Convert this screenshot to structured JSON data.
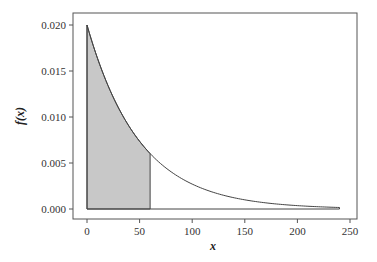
{
  "chart_data": {
    "type": "area",
    "title": "",
    "xlabel": "x",
    "ylabel": "f(x)",
    "xlim": [
      -14,
      262
    ],
    "ylim": [
      -0.0011,
      0.0214
    ],
    "xticks": [
      0,
      50,
      100,
      150,
      200,
      250
    ],
    "yticks": [
      0.0,
      0.005,
      0.01,
      0.015,
      0.02
    ],
    "xtick_labels": [
      "0",
      "50",
      "100",
      "150",
      "200",
      "250"
    ],
    "ytick_labels": [
      "0.000",
      "0.005",
      "0.010",
      "0.015",
      "0.020"
    ],
    "grid": false,
    "series": [
      {
        "name": "f(x) = 0.02 e^(-0.02x)",
        "function": "exponential_pdf",
        "rate": 0.02,
        "x_range": [
          0,
          240
        ],
        "x": [
          0,
          20,
          40,
          60,
          80,
          100,
          120,
          140,
          160,
          180,
          200,
          220,
          240
        ],
        "values": [
          0.02,
          0.0134,
          0.009,
          0.006,
          0.004,
          0.0027,
          0.0018,
          0.0012,
          0.0008,
          0.0005,
          0.0004,
          0.0002,
          0.0002
        ]
      }
    ],
    "shaded_region": {
      "x_from": 0,
      "x_to": 60,
      "color": "#c8c8c8"
    },
    "colors": {
      "line": "#444444",
      "fill": "#c8c8c8",
      "frame": "#555555"
    }
  }
}
